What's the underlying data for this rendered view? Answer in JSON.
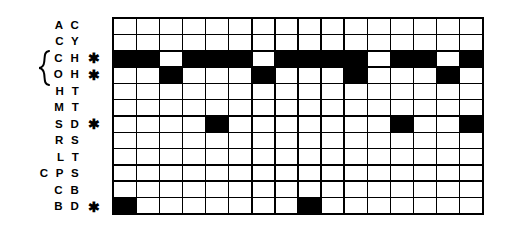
{
  "figure": {
    "type": "binary-occurrence-matrix",
    "columns": 16,
    "rows": 12,
    "fill_color": "#000000",
    "empty_color": "#ffffff",
    "border_color": "#000000",
    "star_glyph": "✱"
  },
  "rows": [
    {
      "label": "A C",
      "starred": false,
      "cells": [
        0,
        0,
        0,
        0,
        0,
        0,
        0,
        0,
        0,
        0,
        0,
        0,
        0,
        0,
        0,
        0
      ]
    },
    {
      "label": "C Y",
      "starred": false,
      "cells": [
        0,
        0,
        0,
        0,
        0,
        0,
        0,
        0,
        0,
        0,
        0,
        0,
        0,
        0,
        0,
        0
      ]
    },
    {
      "label": "C H",
      "starred": true,
      "cells": [
        1,
        1,
        0,
        1,
        1,
        1,
        0,
        1,
        1,
        1,
        1,
        0,
        1,
        1,
        0,
        1
      ]
    },
    {
      "label": "O H",
      "starred": true,
      "cells": [
        0,
        0,
        1,
        0,
        0,
        0,
        1,
        0,
        0,
        0,
        1,
        0,
        0,
        0,
        1,
        0
      ]
    },
    {
      "label": "H T",
      "starred": false,
      "cells": [
        0,
        0,
        0,
        0,
        0,
        0,
        0,
        0,
        0,
        0,
        0,
        0,
        0,
        0,
        0,
        0
      ]
    },
    {
      "label": "M T",
      "starred": false,
      "cells": [
        0,
        0,
        0,
        0,
        0,
        0,
        0,
        0,
        0,
        0,
        0,
        0,
        0,
        0,
        0,
        0
      ]
    },
    {
      "label": "S D",
      "starred": true,
      "cells": [
        0,
        0,
        0,
        0,
        1,
        0,
        0,
        0,
        0,
        0,
        0,
        0,
        1,
        0,
        0,
        1
      ]
    },
    {
      "label": "R S",
      "starred": false,
      "cells": [
        0,
        0,
        0,
        0,
        0,
        0,
        0,
        0,
        0,
        0,
        0,
        0,
        0,
        0,
        0,
        0
      ]
    },
    {
      "label": "L T",
      "starred": false,
      "cells": [
        0,
        0,
        0,
        0,
        0,
        0,
        0,
        0,
        0,
        0,
        0,
        0,
        0,
        0,
        0,
        0
      ]
    },
    {
      "label": "C P S",
      "starred": false,
      "cells": [
        0,
        0,
        0,
        0,
        0,
        0,
        0,
        0,
        0,
        0,
        0,
        0,
        0,
        0,
        0,
        0
      ]
    },
    {
      "label": "C B",
      "starred": false,
      "cells": [
        0,
        0,
        0,
        0,
        0,
        0,
        0,
        0,
        0,
        0,
        0,
        0,
        0,
        0,
        0,
        0
      ]
    },
    {
      "label": "B D",
      "starred": true,
      "cells": [
        1,
        0,
        0,
        0,
        0,
        0,
        0,
        0,
        1,
        0,
        0,
        0,
        0,
        0,
        0,
        0
      ]
    }
  ],
  "brace": {
    "grouped_labels": [
      "C H",
      "O H"
    ]
  }
}
